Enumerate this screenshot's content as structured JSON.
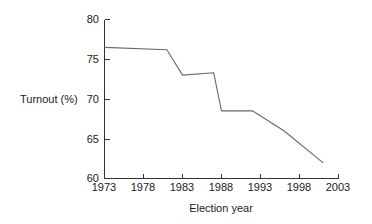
{
  "chart_data": {
    "type": "line",
    "title": "",
    "xlabel": "Election year",
    "ylabel": "Turnout (%)",
    "xlim": [
      1973,
      2003
    ],
    "ylim": [
      60,
      80
    ],
    "grid": false,
    "legend": false,
    "x_ticks": [
      "1973",
      "1978",
      "1983",
      "1988",
      "1993",
      "1998",
      "2003"
    ],
    "x_tick_values": [
      1973,
      1978,
      1983,
      1988,
      1993,
      1998,
      2003
    ],
    "y_ticks": [
      "60",
      "65",
      "70",
      "75",
      "80"
    ],
    "y_tick_values": [
      60,
      65,
      70,
      75,
      80
    ],
    "series": [
      {
        "name": "Turnout",
        "color": "#6a6a6a",
        "x": [
          1973,
          1981,
          1983,
          1987,
          1988,
          1992,
          1996,
          2001
        ],
        "values": [
          76.5,
          76.2,
          73.0,
          73.3,
          68.5,
          68.5,
          66.0,
          62.0
        ]
      }
    ]
  },
  "axis": {
    "y_label": "Turnout (%)",
    "x_label": "Election year"
  }
}
